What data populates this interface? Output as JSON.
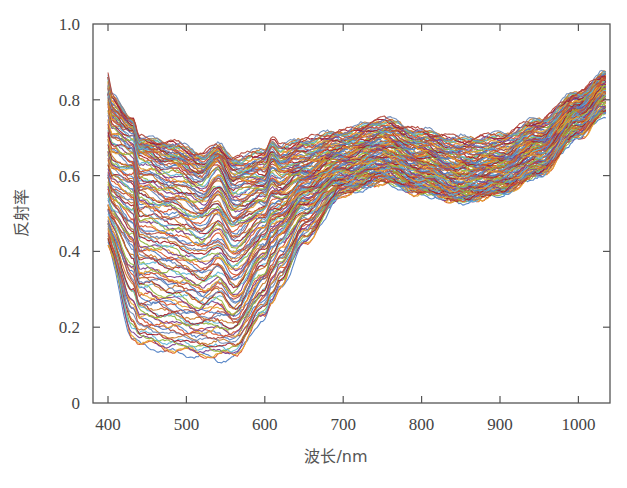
{
  "chart_data": {
    "type": "line",
    "title": "",
    "xlabel": "波长/nm",
    "ylabel": "反射率",
    "xlim": [
      388,
      1035
    ],
    "ylim": [
      0,
      1.0
    ],
    "xticks": [
      400,
      500,
      600,
      700,
      800,
      900,
      1000
    ],
    "xtick_labels": [
      "400",
      "500",
      "600",
      "700",
      "800",
      "900",
      "1000"
    ],
    "yticks": [
      0,
      0.2,
      0.4,
      0.6,
      0.8,
      1.0
    ],
    "ytick_labels": [
      "0",
      "0.2",
      "0.4",
      "0.6",
      "0.8",
      "1.0"
    ],
    "grid": false,
    "legend": null,
    "series_count_approx": 120,
    "x": [
      400,
      432,
      440,
      480,
      520,
      540,
      560,
      600,
      609,
      620,
      650,
      700,
      750,
      800,
      850,
      900,
      950,
      1000,
      1035
    ],
    "series": [
      {
        "name": "upper-envelope",
        "values": [
          0.82,
          0.75,
          0.7,
          0.69,
          0.66,
          0.68,
          0.65,
          0.67,
          0.7,
          0.68,
          0.7,
          0.72,
          0.75,
          0.72,
          0.7,
          0.71,
          0.75,
          0.82,
          0.87
        ]
      },
      {
        "name": "upper-quartile",
        "values": [
          0.75,
          0.72,
          0.66,
          0.63,
          0.6,
          0.64,
          0.58,
          0.59,
          0.63,
          0.61,
          0.63,
          0.67,
          0.7,
          0.67,
          0.64,
          0.65,
          0.7,
          0.79,
          0.85
        ]
      },
      {
        "name": "median",
        "values": [
          0.62,
          0.6,
          0.52,
          0.5,
          0.47,
          0.5,
          0.45,
          0.5,
          0.53,
          0.53,
          0.58,
          0.63,
          0.66,
          0.63,
          0.6,
          0.62,
          0.67,
          0.77,
          0.83
        ]
      },
      {
        "name": "lower-quartile",
        "values": [
          0.5,
          0.42,
          0.34,
          0.32,
          0.29,
          0.31,
          0.27,
          0.38,
          0.42,
          0.45,
          0.52,
          0.59,
          0.62,
          0.59,
          0.56,
          0.58,
          0.63,
          0.74,
          0.8
        ]
      },
      {
        "name": "lower-envelope",
        "values": [
          0.4,
          0.16,
          0.15,
          0.13,
          0.12,
          0.11,
          0.12,
          0.22,
          0.26,
          0.3,
          0.42,
          0.55,
          0.58,
          0.55,
          0.53,
          0.55,
          0.6,
          0.7,
          0.76
        ]
      }
    ],
    "features": [
      {
        "wavelength": 432,
        "type": "peak",
        "note": "sharp spike/dip near 430-440 nm"
      },
      {
        "wavelength": 540,
        "type": "peak"
      },
      {
        "wavelength": 609,
        "type": "peak"
      },
      {
        "wavelength": 750,
        "type": "local-max"
      },
      {
        "wavelength": 860,
        "type": "local-min"
      }
    ]
  },
  "palette": [
    "#4f7fc4",
    "#d9532a",
    "#e6a530",
    "#7a3f8e",
    "#8fb83f",
    "#5fb6d9",
    "#a3202a",
    "#c97b2b",
    "#6d8ab8",
    "#b34a3c"
  ]
}
